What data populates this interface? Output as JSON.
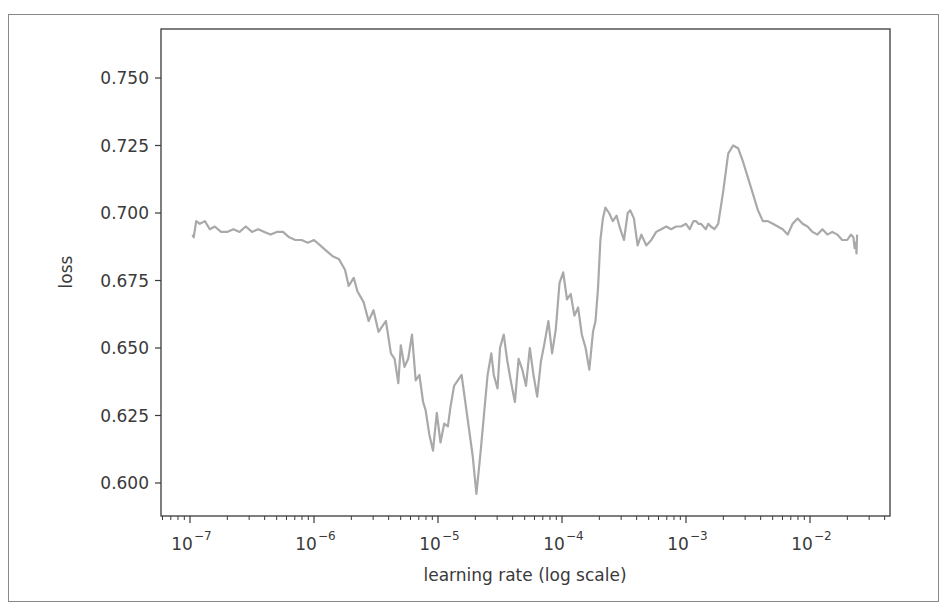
{
  "chart_data": {
    "type": "line",
    "title": "",
    "xlabel": "learning rate (log scale)",
    "ylabel": "loss",
    "xscale": "log",
    "xlim": [
      5.5e-08,
      0.045
    ],
    "ylim": [
      0.588,
      0.763
    ],
    "grid": false,
    "legend": null,
    "line_color": "#a9a9a9",
    "x_ticks": [
      {
        "value": 1e-07,
        "base": "10",
        "exp": "−7"
      },
      {
        "value": 1e-06,
        "base": "10",
        "exp": "−6"
      },
      {
        "value": 1e-05,
        "base": "10",
        "exp": "−5"
      },
      {
        "value": 0.0001,
        "base": "10",
        "exp": "−4"
      },
      {
        "value": 0.001,
        "base": "10",
        "exp": "−3"
      },
      {
        "value": 0.01,
        "base": "10",
        "exp": "−2"
      }
    ],
    "y_ticks": [
      "0.600",
      "0.625",
      "0.650",
      "0.675",
      "0.700",
      "0.725",
      "0.750"
    ],
    "y_tick_values": [
      0.6,
      0.625,
      0.65,
      0.675,
      0.7,
      0.725,
      0.75
    ],
    "series": [
      {
        "name": "loss",
        "log10_x": [
          -6.98,
          -6.97,
          -6.95,
          -6.92,
          -6.88,
          -6.84,
          -6.8,
          -6.75,
          -6.7,
          -6.65,
          -6.6,
          -6.55,
          -6.5,
          -6.45,
          -6.4,
          -6.35,
          -6.3,
          -6.25,
          -6.2,
          -6.15,
          -6.1,
          -6.05,
          -6.0,
          -5.95,
          -5.9,
          -5.85,
          -5.8,
          -5.75,
          -5.72,
          -5.68,
          -5.65,
          -5.6,
          -5.56,
          -5.52,
          -5.48,
          -5.45,
          -5.42,
          -5.38,
          -5.35,
          -5.32,
          -5.3,
          -5.27,
          -5.24,
          -5.21,
          -5.18,
          -5.15,
          -5.12,
          -5.1,
          -5.07,
          -5.04,
          -5.01,
          -4.98,
          -4.95,
          -4.92,
          -4.9,
          -4.87,
          -4.84,
          -4.81,
          -4.78,
          -4.75,
          -4.72,
          -4.69,
          -4.66,
          -4.63,
          -4.6,
          -4.57,
          -4.55,
          -4.52,
          -4.5,
          -4.47,
          -4.44,
          -4.41,
          -4.38,
          -4.35,
          -4.32,
          -4.29,
          -4.26,
          -4.23,
          -4.2,
          -4.17,
          -4.14,
          -4.11,
          -4.08,
          -4.05,
          -4.02,
          -3.99,
          -3.96,
          -3.93,
          -3.9,
          -3.87,
          -3.84,
          -3.81,
          -3.78,
          -3.75,
          -3.73,
          -3.71,
          -3.69,
          -3.67,
          -3.65,
          -3.62,
          -3.59,
          -3.56,
          -3.53,
          -3.5,
          -3.47,
          -3.45,
          -3.42,
          -3.39,
          -3.36,
          -3.32,
          -3.28,
          -3.24,
          -3.2,
          -3.16,
          -3.12,
          -3.08,
          -3.04,
          -3.0,
          -2.97,
          -2.94,
          -2.92,
          -2.9,
          -2.88,
          -2.86,
          -2.84,
          -2.82,
          -2.8,
          -2.77,
          -2.74,
          -2.7,
          -2.66,
          -2.62,
          -2.58,
          -2.54,
          -2.5,
          -2.46,
          -2.42,
          -2.38,
          -2.34,
          -2.3,
          -2.26,
          -2.22,
          -2.18,
          -2.14,
          -2.1,
          -2.06,
          -2.02,
          -1.98,
          -1.94,
          -1.9,
          -1.86,
          -1.82,
          -1.78,
          -1.74,
          -1.7,
          -1.67,
          -1.65,
          -1.64,
          -1.63,
          -1.625,
          -1.62
        ],
        "loss": [
          0.692,
          0.691,
          0.697,
          0.696,
          0.697,
          0.694,
          0.695,
          0.693,
          0.693,
          0.694,
          0.693,
          0.695,
          0.693,
          0.694,
          0.693,
          0.692,
          0.693,
          0.693,
          0.691,
          0.69,
          0.69,
          0.689,
          0.69,
          0.688,
          0.686,
          0.684,
          0.683,
          0.679,
          0.673,
          0.676,
          0.671,
          0.667,
          0.66,
          0.664,
          0.656,
          0.658,
          0.66,
          0.648,
          0.646,
          0.637,
          0.651,
          0.643,
          0.646,
          0.655,
          0.638,
          0.64,
          0.63,
          0.627,
          0.618,
          0.612,
          0.626,
          0.615,
          0.622,
          0.621,
          0.628,
          0.636,
          0.638,
          0.64,
          0.63,
          0.62,
          0.61,
          0.596,
          0.61,
          0.625,
          0.64,
          0.648,
          0.64,
          0.635,
          0.65,
          0.655,
          0.645,
          0.637,
          0.63,
          0.646,
          0.642,
          0.636,
          0.65,
          0.64,
          0.632,
          0.645,
          0.652,
          0.66,
          0.648,
          0.657,
          0.674,
          0.678,
          0.668,
          0.67,
          0.662,
          0.665,
          0.655,
          0.65,
          0.642,
          0.656,
          0.66,
          0.672,
          0.69,
          0.698,
          0.702,
          0.7,
          0.697,
          0.699,
          0.694,
          0.69,
          0.7,
          0.701,
          0.698,
          0.688,
          0.692,
          0.688,
          0.69,
          0.693,
          0.694,
          0.695,
          0.694,
          0.695,
          0.695,
          0.696,
          0.694,
          0.697,
          0.697,
          0.696,
          0.696,
          0.695,
          0.694,
          0.696,
          0.695,
          0.694,
          0.696,
          0.708,
          0.722,
          0.725,
          0.724,
          0.719,
          0.713,
          0.707,
          0.701,
          0.697,
          0.697,
          0.696,
          0.695,
          0.694,
          0.692,
          0.696,
          0.698,
          0.696,
          0.695,
          0.693,
          0.692,
          0.694,
          0.692,
          0.693,
          0.692,
          0.69,
          0.69,
          0.692,
          0.691,
          0.687,
          0.689,
          0.685,
          0.692,
          0.695,
          0.7,
          0.73,
          0.76
        ]
      }
    ]
  }
}
